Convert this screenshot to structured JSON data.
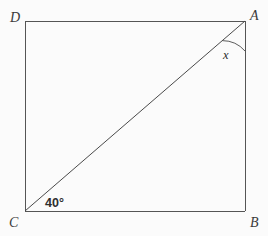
{
  "figure": {
    "kind": "plane-geometry-diagram",
    "canvas": {
      "width": 268,
      "height": 236
    },
    "colors": {
      "background": "#fbfbfb",
      "stroke": "#555555",
      "diagonal_stroke": "#4a4a4a",
      "arc_stroke": "#4a4a4a",
      "label_text": "#3a3a3a",
      "angle_text": "#2e2e2e"
    },
    "vertices": [
      {
        "name": "D",
        "label": "D",
        "x": 25,
        "y": 21,
        "label_x": 10,
        "label_y": 11
      },
      {
        "name": "A",
        "label": "A",
        "x": 245,
        "y": 21,
        "label_x": 250,
        "label_y": 9
      },
      {
        "name": "B",
        "label": "B",
        "x": 245,
        "y": 211,
        "label_x": 250,
        "label_y": 216
      },
      {
        "name": "C",
        "label": "C",
        "x": 25,
        "y": 211,
        "label_x": 9,
        "label_y": 216
      }
    ],
    "edges": [
      {
        "name": "side-DA",
        "from": "D",
        "to": "A"
      },
      {
        "name": "side-AB",
        "from": "A",
        "to": "B"
      },
      {
        "name": "side-BC",
        "from": "B",
        "to": "C"
      },
      {
        "name": "side-CD",
        "from": "C",
        "to": "D"
      }
    ],
    "diagonal": {
      "name": "diagonal-CA",
      "from": "C",
      "to": "A"
    },
    "angles": [
      {
        "name": "angle-at-C",
        "vertex": "C",
        "label": "40°",
        "value": 40,
        "unit": "degrees",
        "has_arc": false,
        "label_x": 45,
        "label_y": 197
      },
      {
        "name": "angle-at-A",
        "vertex": "A",
        "label": "x",
        "value": null,
        "unit": "degrees",
        "has_arc": true,
        "arc_radius": 30,
        "label_x": 223,
        "label_y": 49
      }
    ]
  }
}
